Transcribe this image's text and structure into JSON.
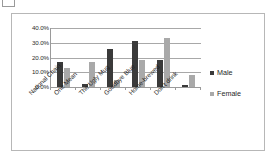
{
  "chart_data": {
    "type": "bar",
    "title": "",
    "subtitle": "",
    "xlabel": "",
    "ylabel": "",
    "ylim": [
      0,
      40
    ],
    "yticks": [
      "0.0%",
      "10.0%",
      "20.0%",
      "30.0%",
      "40.0%"
    ],
    "ytick_values": [
      0,
      10,
      20,
      30,
      40
    ],
    "grid": true,
    "legend_position": "right",
    "categories": [
      "National Chain",
      "One Mean",
      "The Ugly Mug",
      "Goodbye Blue",
      "Home-brewed",
      "Don't drink"
    ],
    "series": [
      {
        "name": "Male",
        "color": "#3a3a3a",
        "values": [
          17.0,
          2.0,
          26.0,
          31.5,
          18.0,
          1.5
        ]
      },
      {
        "name": "Female",
        "color": "#a9a9a9",
        "values": [
          13.0,
          17.0,
          4.5,
          18.5,
          33.5,
          8.0
        ]
      }
    ]
  },
  "legend": {
    "items": [
      {
        "label": "Male",
        "color": "#3a3a3a"
      },
      {
        "label": "Female",
        "color": "#a9a9a9"
      }
    ]
  },
  "colors": {
    "male": "#3a3a3a",
    "female": "#a9a9a9",
    "gridline": "#a8a8a8",
    "axis": "#9a9a9a",
    "frame_border": "#b7b7b7",
    "background": "#ffffff",
    "text": "#1f1f1f"
  }
}
